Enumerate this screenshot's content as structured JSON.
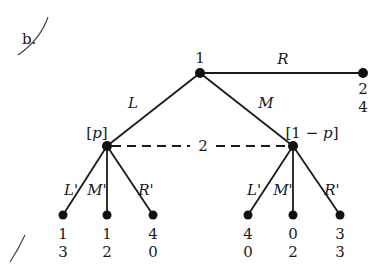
{
  "part_label": "b.",
  "root": {
    "player": "1"
  },
  "root_actions": {
    "left": "L",
    "middle": "M",
    "right": "R"
  },
  "right_terminal_payoffs": [
    "2",
    "4"
  ],
  "info_set": {
    "player": "2",
    "left_belief": "[p]",
    "right_belief": "[1 − p]"
  },
  "player2_actions": [
    "L'",
    "M'",
    "R'"
  ],
  "left_subtree_payoffs": [
    {
      "action": "L'",
      "p1": "1",
      "p2": "3"
    },
    {
      "action": "M'",
      "p1": "1",
      "p2": "2"
    },
    {
      "action": "R'",
      "p1": "4",
      "p2": "0"
    }
  ],
  "right_subtree_payoffs": [
    {
      "action": "L'",
      "p1": "4",
      "p2": "0"
    },
    {
      "action": "M'",
      "p1": "0",
      "p2": "2"
    },
    {
      "action": "R'",
      "p1": "3",
      "p2": "3"
    }
  ]
}
